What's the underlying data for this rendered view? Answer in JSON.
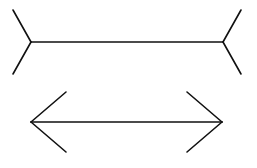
{
  "diagram": {
    "name": "Muller-Lyer illusion",
    "stroke_color": "#111111",
    "background": "#ffffff",
    "figures": [
      {
        "id": "fins-out",
        "shaft": {
          "x1": 31,
          "y1": 42,
          "x2": 223,
          "y2": 42
        },
        "fins": [
          {
            "x1": 31,
            "y1": 42,
            "x2": 13,
            "y2": 10
          },
          {
            "x1": 31,
            "y1": 42,
            "x2": 13,
            "y2": 74
          },
          {
            "x1": 223,
            "y1": 42,
            "x2": 241,
            "y2": 10
          },
          {
            "x1": 223,
            "y1": 42,
            "x2": 241,
            "y2": 74
          }
        ]
      },
      {
        "id": "fins-in",
        "shaft": {
          "x1": 31,
          "y1": 122,
          "x2": 222,
          "y2": 122
        },
        "fins": [
          {
            "x1": 31,
            "y1": 122,
            "x2": 66,
            "y2": 92
          },
          {
            "x1": 31,
            "y1": 122,
            "x2": 66,
            "y2": 152
          },
          {
            "x1": 222,
            "y1": 122,
            "x2": 187,
            "y2": 92
          },
          {
            "x1": 222,
            "y1": 122,
            "x2": 187,
            "y2": 152
          }
        ]
      }
    ]
  }
}
